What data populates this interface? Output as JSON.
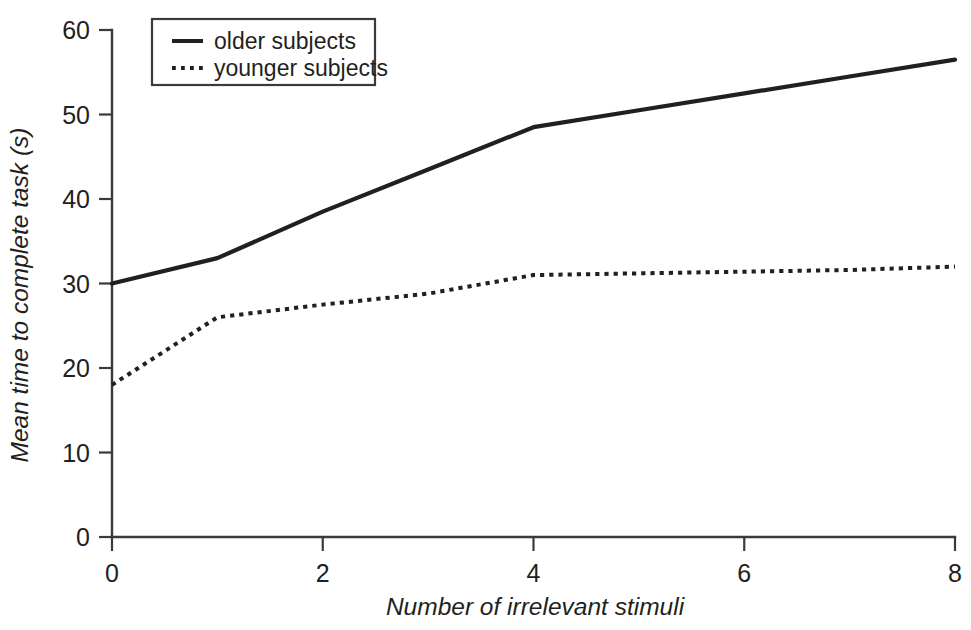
{
  "chart_data": {
    "type": "line",
    "title": "",
    "xlabel": "Number of irrelevant stimuli",
    "ylabel": "Mean time to complete task (s)",
    "x": [
      0,
      1,
      2,
      3,
      4,
      5,
      6,
      7,
      8
    ],
    "xlim": [
      0,
      8
    ],
    "ylim": [
      0,
      60
    ],
    "xticks": [
      0,
      2,
      4,
      6,
      8
    ],
    "xtick_labels": [
      "0",
      "2",
      "4",
      "6",
      "8"
    ],
    "yticks": [
      0,
      10,
      20,
      30,
      40,
      50,
      60
    ],
    "ytick_labels": [
      "0",
      "10",
      "20",
      "30",
      "40",
      "50",
      "60"
    ],
    "grid": false,
    "legend_position": "top-left",
    "series": [
      {
        "name": "older subjects",
        "style": "solid",
        "color": "#231f20",
        "values": [
          30,
          33,
          38.5,
          43.5,
          48.5,
          50.5,
          52.5,
          54.5,
          56.5
        ]
      },
      {
        "name": "younger subjects",
        "style": "dotted",
        "color": "#231f20",
        "values": [
          18,
          26,
          27.5,
          28.8,
          31,
          31.2,
          31.4,
          31.6,
          32
        ]
      }
    ]
  },
  "legend": {
    "items": [
      {
        "label": "older subjects",
        "style": "solid"
      },
      {
        "label": "younger subjects",
        "style": "dotted"
      }
    ]
  },
  "axes": {
    "y_title": "Mean time to complete task (s)",
    "x_title": "Number of irrelevant stimuli"
  }
}
